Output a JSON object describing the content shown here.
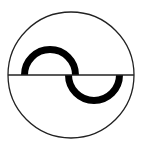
{
  "symbol": {
    "name": "alternating-current",
    "description": "Sine wave inside a circle bisected by a horizontal line",
    "colors": {
      "background": "#ffffff",
      "stroke": "#000000",
      "outline": "#222222"
    },
    "circle": {
      "cx": 71,
      "cy": 75,
      "r": 63,
      "stroke_width": 1.3
    },
    "axis_line": {
      "x1": 8,
      "y1": 75,
      "x2": 134,
      "y2": 75,
      "stroke_width": 1.3
    },
    "wave": {
      "upper_arc": {
        "cx": 50,
        "cy": 75,
        "r": 25.5
      },
      "lower_arc": {
        "cx": 94,
        "cy": 75,
        "r": 25.5
      },
      "stroke_width": 7
    }
  }
}
